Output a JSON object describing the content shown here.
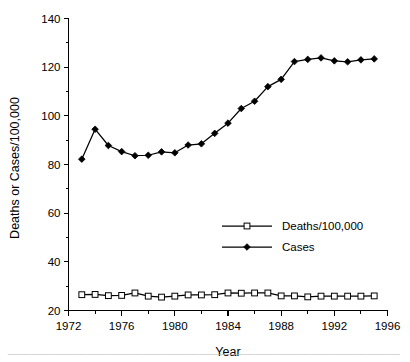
{
  "chart_data": {
    "type": "line",
    "title": "",
    "subtitle": "",
    "xlabel": "Year",
    "ylabel": "Deaths or Cases/100,000",
    "xlim": [
      1972,
      1996
    ],
    "ylim": [
      20,
      140
    ],
    "xticks": [
      1972,
      1976,
      1980,
      1984,
      1988,
      1992,
      1996
    ],
    "xtick_labels": [
      "1972",
      "1976",
      "1980",
      "1984",
      "1988",
      "1992",
      "1996"
    ],
    "x_minor_ticks": [
      1974,
      1978,
      1982,
      1986,
      1990,
      1994
    ],
    "yticks": [
      20,
      40,
      60,
      80,
      100,
      120,
      140
    ],
    "ytick_labels": [
      "20",
      "40",
      "60",
      "80",
      "100",
      "120",
      "140"
    ],
    "y_minor_ticks": [
      30,
      50,
      70,
      90,
      110,
      130
    ],
    "grid": false,
    "legend_position": "center-right",
    "x": [
      1973,
      1974,
      1975,
      1976,
      1977,
      1978,
      1979,
      1980,
      1981,
      1982,
      1983,
      1984,
      1985,
      1986,
      1987,
      1988,
      1989,
      1990,
      1991,
      1992,
      1993,
      1994,
      1995
    ],
    "series": [
      {
        "name": "Cases",
        "marker": "filled-diamond",
        "color": "#000000",
        "values": [
          82.2,
          94.5,
          87.8,
          85.3,
          83.6,
          83.8,
          85.2,
          84.8,
          88.0,
          88.5,
          92.8,
          97.0,
          103.0,
          106.0,
          112.0,
          115.0,
          122.3,
          123.2,
          123.8,
          122.6,
          122.2,
          123.0,
          123.4
        ]
      },
      {
        "name": "Deaths/100,000",
        "marker": "open-square",
        "color": "#000000",
        "values": [
          26.5,
          26.6,
          26.1,
          26.2,
          27.2,
          25.9,
          25.5,
          25.9,
          26.4,
          26.4,
          26.5,
          27.2,
          27.1,
          27.2,
          27.2,
          26.0,
          26.0,
          25.6,
          25.9,
          25.9,
          25.9,
          25.9,
          26.0
        ]
      }
    ]
  },
  "axis": {
    "ylabel": "Deaths or Cases/100,000",
    "xlabel": "Year"
  },
  "legend": {
    "entries": [
      {
        "label": "Deaths/100,000",
        "marker": "open-square"
      },
      {
        "label": "Cases",
        "marker": "filled-diamond"
      }
    ]
  },
  "caption": {
    "text": "partial caption line clipped at page bottom"
  }
}
